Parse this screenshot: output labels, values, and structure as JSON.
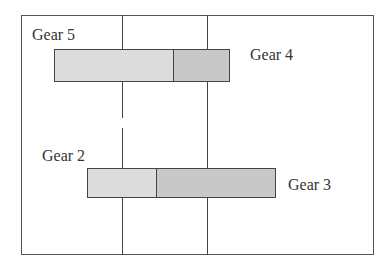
{
  "diagram": {
    "frame": {
      "left": 21,
      "top": 15,
      "right": 374,
      "bottom": 255
    },
    "vertical_lines": [
      {
        "x": 122,
        "top": 15,
        "bottom": 255,
        "gap": [
          118,
          128
        ]
      },
      {
        "x": 207,
        "top": 15,
        "bottom": 255
      }
    ],
    "bars": [
      {
        "name": "top",
        "left": 54,
        "right": 229,
        "top": 49,
        "bottom": 82,
        "divider": 173,
        "labels": {
          "left": "Gear 5",
          "right": "Gear 4"
        }
      },
      {
        "name": "bottom",
        "left": 87,
        "right": 275,
        "top": 168,
        "bottom": 197,
        "divider": 156,
        "labels": {
          "left": "Gear 2",
          "right": "Gear 3"
        }
      }
    ]
  },
  "labels": {
    "gear5": "Gear 5",
    "gear4": "Gear 4",
    "gear2": "Gear 2",
    "gear3": "Gear 3"
  },
  "colors": {
    "line": "#444444",
    "bar_light": "#dcdcdc",
    "bar_dark": "#c8c8c8",
    "text": "#333333"
  }
}
